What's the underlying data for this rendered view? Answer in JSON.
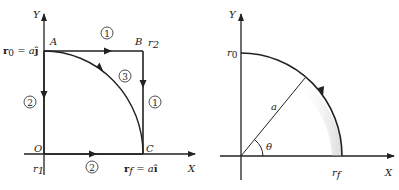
{
  "left_diagram": {
    "axis_x_label": "X",
    "axis_y_label": "Y",
    "point_A": "A",
    "point_B": "B",
    "point_C": "C",
    "point_O": "O",
    "r0_label_bold": "r",
    "r0_sub": "0",
    "r0_eq": " = a",
    "r0_unit": "ĵ",
    "r2_label": "r",
    "r2_sub": "2",
    "r1_label": "r",
    "r1_sub": "1",
    "rf_label_bold": "r",
    "rf_sub": "f",
    "rf_eq": " = a",
    "rf_unit": "î",
    "path_1_top": "1",
    "path_1_right": "1",
    "path_2_left": "2",
    "path_2_bottom": "2",
    "path_3_arc": "3"
  },
  "right_diagram": {
    "axis_x_label": "X",
    "axis_y_label": "Y",
    "r0_label": "r",
    "r0_sub": "0",
    "rf_label": "r",
    "rf_sub": "f",
    "radius_label": "a",
    "angle_label": "θ"
  }
}
